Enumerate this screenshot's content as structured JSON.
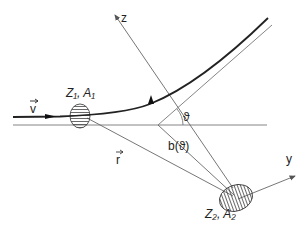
{
  "diagram": {
    "labels": {
      "velocity": "v",
      "projectile": "Z₁, A₁",
      "target": "Z₂, A₂",
      "z_axis": "z",
      "y_axis": "y",
      "position_vector": "r",
      "impact_parameter": "b(ϑ)",
      "scattering_angle": "ϑ"
    },
    "colors": {
      "trajectory": "#222222",
      "axes": "#666666",
      "hatch": "#444444",
      "background": "#ffffff"
    }
  }
}
